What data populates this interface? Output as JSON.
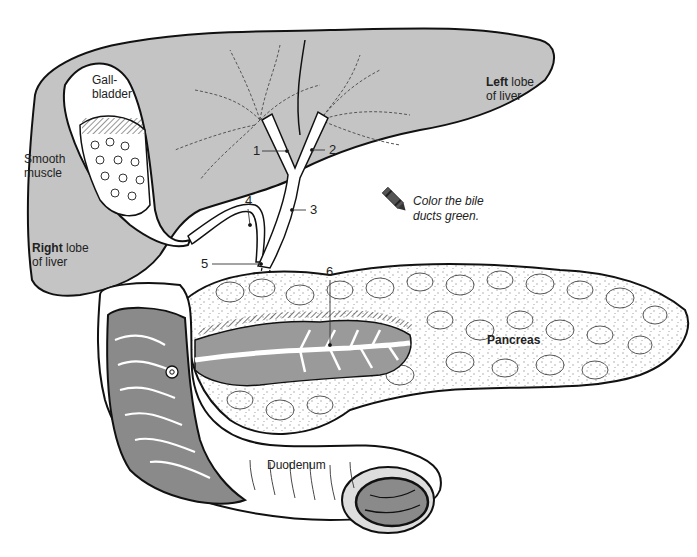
{
  "diagram": {
    "colors": {
      "liver_fill": "#c4c4c4",
      "mucosa_fill": "#8a8a8a",
      "pancreas_fill": "#ffffff",
      "outline": "#111111"
    },
    "labels": {
      "gallbladder_line1": "Gall-",
      "gallbladder_line2": "bladder",
      "smooth_muscle_line1": "Smooth",
      "smooth_muscle_line2": "muscle",
      "left_lobe_bold": "Left",
      "left_lobe_rest": " lobe",
      "left_lobe_line2": "of liver",
      "right_lobe_bold": "Right",
      "right_lobe_rest": " lobe",
      "right_lobe_line2": "of liver",
      "pancreas": "Pancreas",
      "duodenum": "Duodenum"
    },
    "numbered_structures": [
      {
        "number": "1"
      },
      {
        "number": "2"
      },
      {
        "number": "3"
      },
      {
        "number": "4"
      },
      {
        "number": "5"
      },
      {
        "number": "6"
      }
    ],
    "instruction": {
      "icon": "crayon-icon",
      "line1": "Color the bile",
      "line2": "ducts green."
    }
  }
}
